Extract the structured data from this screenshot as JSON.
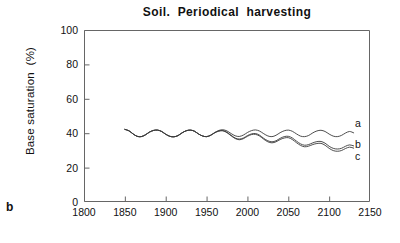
{
  "figure": {
    "panel_label": "b",
    "title": "Soil.  Periodical  harvesting"
  },
  "axes": {
    "ylabel": "Base saturation  (%)",
    "xlabel": "",
    "yticks": [
      0,
      20,
      40,
      60,
      80,
      100
    ],
    "xticks": [
      1800,
      1850,
      1900,
      1950,
      2000,
      2050,
      2100,
      2150
    ]
  },
  "series_labels": {
    "a": "a",
    "b": "b",
    "c": "c"
  },
  "colors": {
    "line": "#3a3a3a",
    "axis": "#555555",
    "text": "#111111",
    "background": "#ffffff"
  },
  "chart_data": {
    "type": "line",
    "title": "Soil.  Periodical  harvesting",
    "xlabel": "",
    "ylabel": "Base saturation  (%)",
    "xlim": [
      1800,
      2150
    ],
    "ylim": [
      0,
      100
    ],
    "xticks": [
      1800,
      1850,
      1900,
      1950,
      2000,
      2050,
      2100,
      2150
    ],
    "yticks": [
      0,
      20,
      40,
      60,
      80,
      100
    ],
    "grid": false,
    "legend_position": "right-inline",
    "x": [
      1850,
      1855,
      1860,
      1865,
      1870,
      1875,
      1880,
      1885,
      1890,
      1895,
      1900,
      1905,
      1910,
      1915,
      1920,
      1925,
      1930,
      1935,
      1940,
      1945,
      1950,
      1955,
      1960,
      1965,
      1970,
      1975,
      1980,
      1985,
      1990,
      1995,
      2000,
      2005,
      2010,
      2015,
      2020,
      2025,
      2030,
      2035,
      2040,
      2045,
      2050,
      2055,
      2060,
      2065,
      2070,
      2075,
      2080,
      2085,
      2090,
      2095,
      2100,
      2105,
      2110,
      2115,
      2120,
      2125,
      2130
    ],
    "series": [
      {
        "name": "a",
        "values": [
          42.2,
          41.4,
          39.6,
          38.2,
          38.0,
          39.0,
          40.6,
          41.6,
          41.8,
          41.0,
          39.4,
          38.2,
          37.9,
          38.6,
          40.2,
          41.4,
          41.8,
          41.2,
          39.6,
          38.4,
          38.0,
          38.8,
          40.4,
          41.6,
          42.0,
          41.3,
          39.8,
          38.5,
          38.1,
          38.9,
          40.4,
          41.5,
          41.9,
          41.2,
          39.7,
          38.4,
          38.0,
          38.8,
          40.3,
          41.4,
          41.8,
          41.1,
          39.6,
          38.3,
          38.0,
          38.7,
          40.2,
          41.3,
          41.7,
          41.0,
          39.5,
          38.3,
          38.0,
          38.7,
          40.1,
          41.0,
          40.2
        ]
      },
      {
        "name": "b",
        "values": [
          42.2,
          41.4,
          39.6,
          38.2,
          38.0,
          39.0,
          40.6,
          41.6,
          41.8,
          41.0,
          39.4,
          38.2,
          37.9,
          38.6,
          40.2,
          41.4,
          41.8,
          41.2,
          39.6,
          38.4,
          38.0,
          38.8,
          40.3,
          41.3,
          41.5,
          40.5,
          38.8,
          37.2,
          36.6,
          37.2,
          38.6,
          39.6,
          39.8,
          38.8,
          37.0,
          35.6,
          35.0,
          35.6,
          37.0,
          38.0,
          38.2,
          37.2,
          35.4,
          33.8,
          33.0,
          33.4,
          34.4,
          35.1,
          35.2,
          34.2,
          32.4,
          31.2,
          30.8,
          31.2,
          32.4,
          33.2,
          32.6
        ]
      },
      {
        "name": "c",
        "values": [
          42.2,
          41.4,
          39.6,
          38.2,
          38.0,
          39.0,
          40.6,
          41.6,
          41.8,
          41.0,
          39.4,
          38.2,
          37.9,
          38.6,
          40.2,
          41.4,
          41.8,
          41.2,
          39.6,
          38.4,
          38.0,
          38.8,
          40.2,
          41.2,
          41.4,
          40.3,
          38.5,
          36.9,
          36.2,
          36.8,
          38.2,
          39.2,
          39.3,
          38.3,
          36.5,
          35.0,
          34.4,
          35.0,
          36.3,
          37.2,
          37.4,
          36.3,
          34.5,
          32.9,
          32.1,
          32.5,
          33.4,
          34.0,
          34.1,
          33.0,
          31.2,
          29.9,
          29.5,
          29.9,
          31.1,
          31.9,
          31.3
        ]
      }
    ]
  }
}
